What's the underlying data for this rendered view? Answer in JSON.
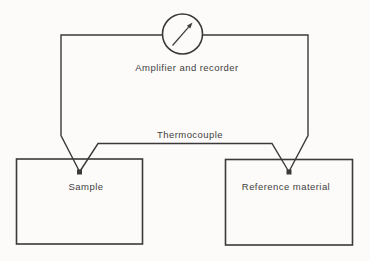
{
  "diagram": {
    "type": "schematic",
    "meter": {
      "label": "Amplifier and recorder",
      "shape": "gauge-circle-with-needle"
    },
    "wire": {
      "label": "Thermocouple"
    },
    "nodes": [
      {
        "id": "sample",
        "label": "Sample",
        "shape": "rectangle"
      },
      {
        "id": "reference",
        "label": "Reference material",
        "shape": "rectangle"
      }
    ]
  },
  "colors": {
    "line": "#3a3a3a",
    "text": "#3f3f3f",
    "background": "#fcfbf9"
  }
}
